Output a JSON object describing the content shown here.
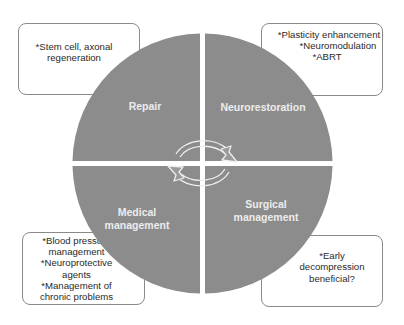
{
  "diagram": {
    "type": "cycle-quadrant",
    "colors": {
      "quadrant_fill": "#8c8c8c",
      "label_text": "#ececec",
      "box_border": "#8a8a8a",
      "box_text": "#2a2a2a",
      "arrow_stroke": "#eeeeee"
    },
    "quadrants": [
      {
        "id": "top-left",
        "label_lines": [
          "Repair"
        ]
      },
      {
        "id": "top-right",
        "label_lines": [
          "Neurorestoration"
        ]
      },
      {
        "id": "bottom-left",
        "label_lines": [
          "Medical",
          "management"
        ]
      },
      {
        "id": "bottom-right",
        "label_lines": [
          "Surgical",
          "management"
        ]
      }
    ],
    "notes": [
      {
        "id": "top-left",
        "lines": [
          "*Stem cell, axonal",
          "regeneration"
        ]
      },
      {
        "id": "top-right",
        "lines": [
          "*Plasticity enhancement",
          "*Neuromodulation",
          "*ABRT"
        ]
      },
      {
        "id": "bottom-left",
        "lines": [
          "*Blood pressure",
          "management",
          "*Neuroprotective",
          "agents",
          "*Management of",
          "chronic problems"
        ]
      },
      {
        "id": "bottom-right",
        "lines": [
          "*Early",
          "decompression",
          "beneficial?"
        ]
      }
    ],
    "center_arrows": [
      "clockwise-top-arrow",
      "clockwise-bottom-arrow"
    ]
  }
}
